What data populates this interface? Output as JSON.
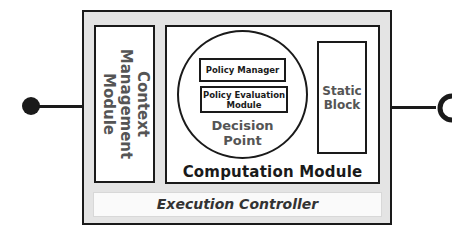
{
  "diagram": {
    "interfaces": {
      "left": {
        "type": "provided-interface",
        "shape": "filled-circle"
      },
      "right": {
        "type": "required-interface",
        "shape": "socket"
      }
    },
    "context_module": {
      "label": "Context\nManagement\nModule"
    },
    "computation_module": {
      "label": "Computation Module",
      "decision_point": {
        "label": "Decision\nPoint",
        "components": [
          {
            "label": "Policy Manager"
          },
          {
            "label": "Policy Evaluation\nModule"
          }
        ]
      },
      "static_block": {
        "label": "Static\nBlock"
      }
    },
    "execution_controller": {
      "label": "Execution Controller"
    },
    "colors": {
      "outline": "#1a1a1a",
      "container_fill": "#e4e4e4",
      "box_fill": "#ffffff",
      "muted_text": "#555555"
    }
  }
}
